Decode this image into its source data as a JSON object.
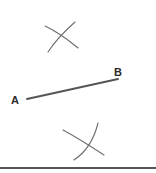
{
  "figure": {
    "background_color": "#ffffff",
    "stroke_color": "#555555",
    "arc_color": "#6e6e6e",
    "label_color": "#2b2b2b",
    "width": 156,
    "height": 173
  },
  "labels": {
    "point_a": "A",
    "point_b": "B"
  },
  "geometry": {
    "segment_ab": {
      "name": "segment-ab",
      "x1": 27,
      "y1": 99,
      "x2": 118,
      "y2": 79,
      "stroke_width": 2.0
    },
    "label_a_position": {
      "x": 15,
      "y": 104
    },
    "label_b_position": {
      "x": 118,
      "y": 76
    },
    "upper_arc_1": {
      "name": "upper-arc-falling",
      "path": "M 45 26 Q 60 33 78 48",
      "stroke_width": 1.1
    },
    "upper_arc_2": {
      "name": "upper-arc-rising",
      "path": "M 48 52 Q 57 38 75 22",
      "stroke_width": 1.1
    },
    "lower_arc_1": {
      "name": "lower-arc-falling",
      "path": "M 63 130 Q 78 138 104 155",
      "stroke_width": 1.1
    },
    "lower_arc_2": {
      "name": "lower-arc-rising",
      "path": "M 74 160 Q 92 148 98 123",
      "stroke_width": 1.1
    },
    "baseline": {
      "name": "baseline",
      "x1": 0,
      "y1": 168,
      "x2": 156,
      "y2": 168,
      "stroke_width": 2.0
    }
  }
}
